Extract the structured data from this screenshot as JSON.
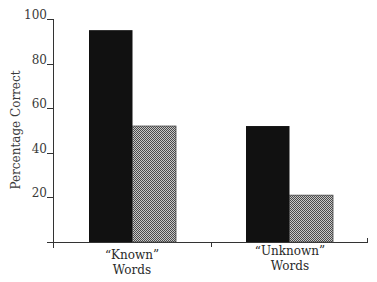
{
  "chart_data": {
    "type": "bar",
    "title": "",
    "xlabel": "",
    "ylabel": "Percentage  Correct",
    "ylim": [
      0,
      100
    ],
    "yticks": [
      20,
      40,
      60,
      80,
      100
    ],
    "categories": [
      {
        "line1": "“Known”",
        "line2": "Words"
      },
      {
        "line1": "“Unknown”",
        "line2": "Words"
      }
    ],
    "series": [
      {
        "name": "Series 1 (solid black)",
        "color": "#111111",
        "values": [
          95,
          52
        ]
      },
      {
        "name": "Series 2 (gray halftone)",
        "color": "#8a8a8a",
        "values": [
          52,
          21
        ]
      }
    ],
    "grid": false,
    "legend": null
  }
}
